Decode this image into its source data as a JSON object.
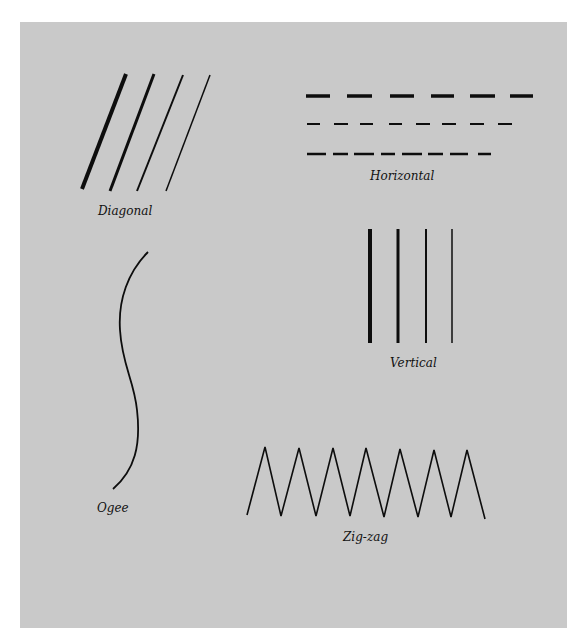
{
  "figure": {
    "background": "#c9c9c9",
    "ink": "#0d0d0d",
    "labels": {
      "diagonal": "Diagonal",
      "horizontal": "Horizontal",
      "ogee": "Ogee",
      "vertical": "Vertical",
      "zigzag": "Zig-zag"
    }
  }
}
